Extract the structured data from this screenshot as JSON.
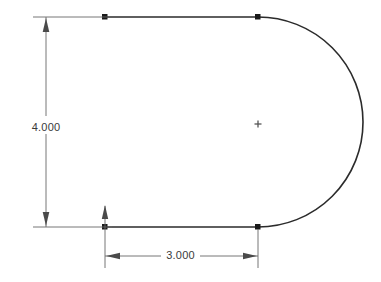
{
  "drawing": {
    "type": "2d-cad-sketch",
    "background_color": "#ffffff",
    "geometry_color": "#2b2b2b",
    "dimension_color": "#555555",
    "text_color": "#3a3a3a",
    "shape_name": "d-shape-profile",
    "description": "Open D-shaped sketch profile: two horizontal parallel lines closed on the right by a semicircular arc",
    "entities": {
      "top_line": {
        "x1": 105,
        "y1": 17,
        "x2": 258,
        "y2": 17
      },
      "bottom_line": {
        "x1": 105,
        "y1": 227,
        "x2": 258,
        "y2": 227
      },
      "arc": {
        "center_x": 258,
        "center_y": 122,
        "radius": 105,
        "start_x": 258,
        "start_y": 17,
        "end_x": 258,
        "end_y": 227,
        "rightmost_x": 363
      },
      "center_mark": {
        "x": 258,
        "y": 124,
        "size": 7
      },
      "points": [
        {
          "name": "top-left-endpoint",
          "x": 105,
          "y": 17
        },
        {
          "name": "top-right-endpoint",
          "x": 258,
          "y": 17
        },
        {
          "name": "bottom-left-endpoint",
          "x": 105,
          "y": 227
        },
        {
          "name": "bottom-right-endpoint",
          "x": 258,
          "y": 227
        }
      ]
    },
    "dimensions": [
      {
        "id": "vertical-height",
        "label": "4.000",
        "value": 4.0,
        "orientation": "vertical",
        "dim_line_x": 46,
        "y_top": 17,
        "y_bottom": 227,
        "text_x": 35,
        "text_y": 128,
        "ext_line_left_x": 33,
        "ext_line_right_x": 110
      },
      {
        "id": "horizontal-width",
        "label": "3.000",
        "value": 3.0,
        "orientation": "horizontal",
        "dim_line_y": 256,
        "x_left": 105,
        "x_right": 258,
        "text_x": 180,
        "text_y": 260,
        "ext_line_top_y": 206,
        "ext_line_bottom_y": 268
      }
    ]
  }
}
